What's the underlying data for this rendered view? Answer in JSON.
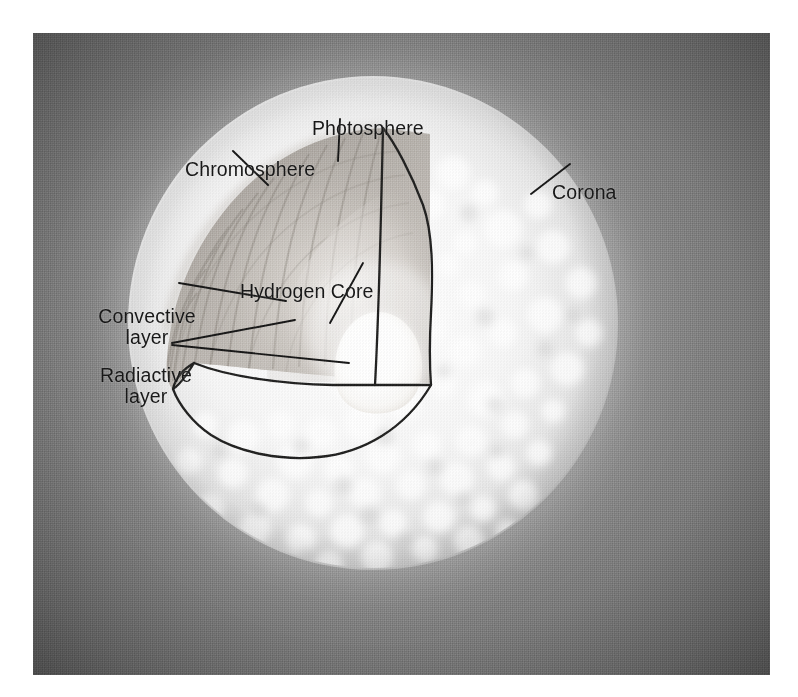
{
  "figure": {
    "kind": "cutaway-diagram",
    "frame": {
      "x": 33,
      "y": 33,
      "width": 737,
      "height": 642
    }
  },
  "labels": {
    "photosphere": "Photosphere",
    "chromosphere": "Chromosphere",
    "corona": "Corona",
    "hydrogen_core": "Hydrogen Core",
    "convective_line1": "Convective",
    "convective_line2": "layer",
    "radiactive_line1": "Radiactive",
    "radiactive_line2": "layer"
  },
  "layers": [
    {
      "name": "Corona",
      "description": "outer diffuse halo surrounding the solar disk"
    },
    {
      "name": "Photosphere",
      "description": "granulated visible surface of the sun"
    },
    {
      "name": "Chromosphere",
      "description": "thin layer just above the photosphere"
    },
    {
      "name": "Convective layer",
      "description": "radially striated shell inside the cutaway wedge"
    },
    {
      "name": "Radiactive layer",
      "description": "smooth shell between convective zone and core"
    },
    {
      "name": "Hydrogen Core",
      "description": "bright white central core"
    }
  ],
  "colors": {
    "plate_background": "#8a8a8a",
    "plate_corner": "#3a3a3a",
    "disk_glow": "#f2f2f2",
    "core_highlight": "#ffffff",
    "cutaway_shade": "#a8a29c",
    "annotation_ink": "#161616",
    "page_background": "#ffffff"
  }
}
